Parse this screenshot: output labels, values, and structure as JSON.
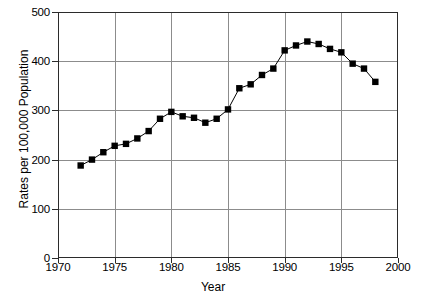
{
  "chart_data": {
    "type": "line",
    "title": "",
    "xlabel": "Year",
    "ylabel": "Rates per 100,000 Population",
    "xlim": [
      1970,
      2000
    ],
    "ylim": [
      0,
      500
    ],
    "grid": true,
    "legend": "none",
    "marker": "filled-square",
    "xticks": [
      1970,
      1975,
      1980,
      1985,
      1990,
      1995,
      2000
    ],
    "xtick_labels": [
      "1970",
      "1975",
      "1980",
      "1985",
      "1990",
      "1995",
      "2000"
    ],
    "yticks": [
      0,
      100,
      200,
      300,
      400,
      500
    ],
    "ytick_labels": [
      "0",
      "100",
      "200",
      "300",
      "400",
      "500"
    ],
    "series": [
      {
        "name": "Rate",
        "x": [
          1972,
          1973,
          1974,
          1975,
          1976,
          1977,
          1978,
          1979,
          1980,
          1981,
          1982,
          1983,
          1984,
          1985,
          1986,
          1987,
          1988,
          1989,
          1990,
          1991,
          1992,
          1993,
          1994,
          1995,
          1996,
          1997,
          1998
        ],
        "values": [
          188,
          200,
          215,
          228,
          232,
          243,
          258,
          283,
          297,
          288,
          285,
          275,
          283,
          302,
          345,
          353,
          372,
          385,
          422,
          432,
          440,
          435,
          425,
          418,
          395,
          385,
          358
        ]
      }
    ]
  },
  "axes": {
    "line_color": "#000000",
    "grid_color": "#8c8c8c",
    "marker_color": "#000000"
  }
}
